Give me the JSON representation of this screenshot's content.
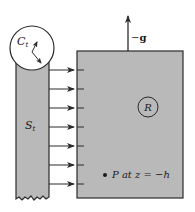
{
  "diagram": {
    "labels": {
      "circle_c": "C",
      "circle_c_sub": "t",
      "strip": "S",
      "strip_sub": "t",
      "region": "R",
      "gravity_minus": "−",
      "gravity_g": "g",
      "point": "P at z = −h"
    },
    "arrow_count": 7,
    "colors": {
      "fill": "#b9b9b9",
      "stroke": "#2a2a2a",
      "background": "#ffffff"
    }
  }
}
